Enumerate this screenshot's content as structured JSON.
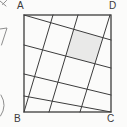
{
  "figure": {
    "vertices": [
      {
        "label": "A",
        "position": "top-left"
      },
      {
        "label": "D",
        "position": "top-right"
      },
      {
        "label": "B",
        "position": "bottom-left"
      },
      {
        "label": "C",
        "position": "bottom-right"
      }
    ],
    "square": {
      "x": 24,
      "y": 15,
      "width": 87,
      "height": 97
    },
    "grid_lines": {
      "shallow": [
        [
          24,
          15,
          111,
          40
        ],
        [
          24,
          45,
          111,
          68
        ],
        [
          24,
          74,
          111,
          95
        ],
        [
          24,
          96,
          111,
          112
        ]
      ],
      "steep": [
        [
          24,
          112,
          53,
          15
        ],
        [
          49,
          112,
          78,
          15
        ],
        [
          80,
          112,
          110,
          15
        ]
      ]
    },
    "shaded_cell_points": "73.7,29.3 103,37.7 94.9,63.7 65.7,56",
    "colors": {
      "line": "#3c3c3c",
      "shade": "#e9e9e8",
      "background": "#fbfbfa",
      "label": "#3a3a3a",
      "fragment": "#8d8d8d"
    }
  },
  "margin_fragments": [
    {
      "name": "cropped-glyph-top",
      "path": "M0,1 L6,6 M6.5,0.5 L2.5,4.5"
    },
    {
      "name": "cropped-glyph-middle",
      "path": "M0,29 L7,28 L1.5,45"
    },
    {
      "name": "cropped-glyph-bottom-arc",
      "path": "M1,95 Q7.5,105.5 0.5,116"
    }
  ]
}
